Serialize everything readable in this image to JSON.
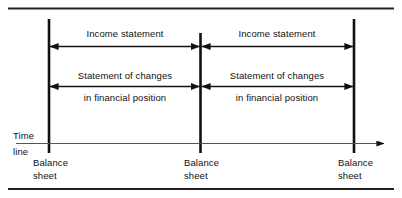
{
  "figure": {
    "background_color": "#ffffff",
    "ink_color": "#111111",
    "border_color": "#222222"
  },
  "borders": {
    "top_rule_label": "top-rule",
    "bottom_rule_label": "bottom-rule"
  },
  "timeline": {
    "label_line1": "Time",
    "label_line2": "line",
    "axis_name": "time-axis"
  },
  "periods": [
    {
      "id": "period-1",
      "income_statement": "Income statement",
      "changes_line1": "Statement of changes",
      "changes_line2": "in financial position"
    },
    {
      "id": "period-2",
      "income_statement": "Income statement",
      "changes_line1": "Statement of changes",
      "changes_line2": "in financial position"
    }
  ],
  "markers": [
    {
      "id": "marker-1",
      "line1": "Balance",
      "line2": "sheet"
    },
    {
      "id": "marker-2",
      "line1": "Balance",
      "line2": "sheet"
    },
    {
      "id": "marker-3",
      "line1": "Balance",
      "line2": "sheet"
    }
  ]
}
